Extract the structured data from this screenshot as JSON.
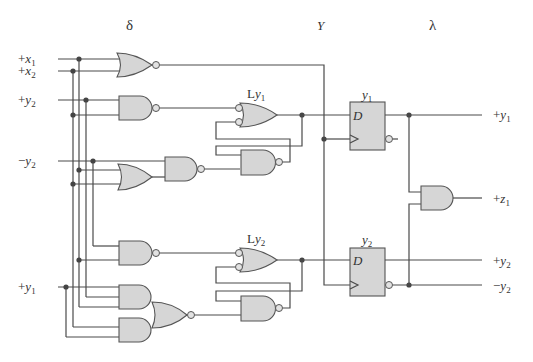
{
  "sections": {
    "delta": "δ",
    "Y": "Y",
    "lambda": "λ"
  },
  "inputs": [
    {
      "sign": "+",
      "var": "x",
      "sub": "1"
    },
    {
      "sign": "+",
      "var": "x",
      "sub": "2"
    },
    {
      "sign": "+",
      "var": "y",
      "sub": "2"
    },
    {
      "sign": "−",
      "var": "y",
      "sub": "2"
    },
    {
      "sign": "+",
      "var": "y",
      "sub": "1"
    }
  ],
  "latches": [
    {
      "prefix": "L",
      "var": "y",
      "sub": "1"
    },
    {
      "prefix": "L",
      "var": "y",
      "sub": "2"
    }
  ],
  "flipflops": [
    {
      "name_var": "y",
      "name_sub": "1",
      "d_label": "D"
    },
    {
      "name_var": "y",
      "name_sub": "2",
      "d_label": "D"
    }
  ],
  "outputs": [
    {
      "sign": "+",
      "var": "y",
      "sub": "1"
    },
    {
      "sign": "+",
      "var": "z",
      "sub": "1"
    },
    {
      "sign": "+",
      "var": "y",
      "sub": "2"
    },
    {
      "sign": "−",
      "var": "y",
      "sub": "2"
    }
  ],
  "colors": {
    "gate_fill": "#d6d6d6",
    "wire": "#4a4a4a"
  }
}
